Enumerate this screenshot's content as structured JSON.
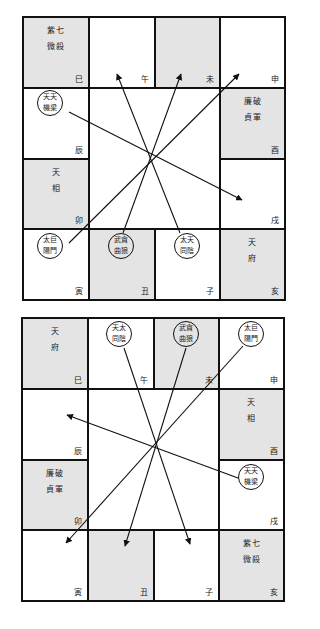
{
  "colors": {
    "shaded": "#e4e4e4",
    "line": "#111111",
    "background": "#ffffff"
  },
  "charts": [
    {
      "name": "top-chart",
      "cells": {
        "si": {
          "branch": "巳",
          "stars": [
            "紫七",
            "微殺"
          ],
          "shaded": true
        },
        "wu": {
          "branch": "午",
          "stars": [],
          "shaded": false
        },
        "wei": {
          "branch": "未",
          "stars": [],
          "shaded": true
        },
        "shen": {
          "branch": "申",
          "stars": [],
          "shaded": false
        },
        "chen": {
          "branch": "辰",
          "circle": [
            "天天",
            "機梁"
          ],
          "shaded": false
        },
        "you": {
          "branch": "酉",
          "stars": [
            "廉破",
            "貞軍"
          ],
          "shaded": true
        },
        "mao": {
          "branch": "卯",
          "stars": [
            "天",
            "相"
          ],
          "shaded": true
        },
        "xu": {
          "branch": "戌",
          "stars": [],
          "shaded": false
        },
        "yin": {
          "branch": "寅",
          "circle": [
            "太巨",
            "陽門"
          ],
          "shaded": false
        },
        "chou": {
          "branch": "丑",
          "circle": [
            "武貪",
            "曲狼"
          ],
          "shaded": true
        },
        "zi": {
          "branch": "子",
          "circle": [
            "太天",
            "同陰"
          ],
          "shaded": false
        },
        "hai": {
          "branch": "亥",
          "stars": [
            "天",
            "府"
          ],
          "shaded": true
        }
      },
      "arrows": [
        {
          "from": "天機天梁 (辰)",
          "to": "戌"
        },
        {
          "from": "太陽巨門 (寅)",
          "to": "申"
        },
        {
          "from": "武曲貪狼 (丑)",
          "to": "未"
        },
        {
          "from": "太陰天同 (子)",
          "to": "午"
        }
      ]
    },
    {
      "name": "bottom-chart",
      "cells": {
        "si": {
          "branch": "巳",
          "stars": [
            "天",
            "府"
          ],
          "shaded": true
        },
        "wu": {
          "branch": "午",
          "circle": [
            "天太",
            "同陰"
          ],
          "shaded": false
        },
        "wei": {
          "branch": "未",
          "circle": [
            "武貪",
            "曲狼"
          ],
          "shaded": true
        },
        "shen": {
          "branch": "申",
          "circle": [
            "太巨",
            "陽門"
          ],
          "shaded": false
        },
        "chen": {
          "branch": "辰",
          "stars": [],
          "shaded": false
        },
        "you": {
          "branch": "酉",
          "stars": [
            "天",
            "相"
          ],
          "shaded": true
        },
        "mao": {
          "branch": "卯",
          "stars": [
            "廉破",
            "貞軍"
          ],
          "shaded": true
        },
        "xu": {
          "branch": "戌",
          "circle": [
            "天天",
            "機梁"
          ],
          "shaded": false
        },
        "yin": {
          "branch": "寅",
          "stars": [],
          "shaded": false
        },
        "chou": {
          "branch": "丑",
          "stars": [],
          "shaded": true
        },
        "zi": {
          "branch": "子",
          "stars": [],
          "shaded": false
        },
        "hai": {
          "branch": "亥",
          "stars": [
            "紫七",
            "微殺"
          ],
          "shaded": true
        }
      },
      "arrows": [
        {
          "from": "天機天梁 (戌)",
          "to": "辰"
        },
        {
          "from": "太陽巨門 (申)",
          "to": "寅"
        },
        {
          "from": "武曲貪狼 (未)",
          "to": "丑"
        },
        {
          "from": "天同太陰 (午)",
          "to": "子"
        }
      ]
    }
  ]
}
